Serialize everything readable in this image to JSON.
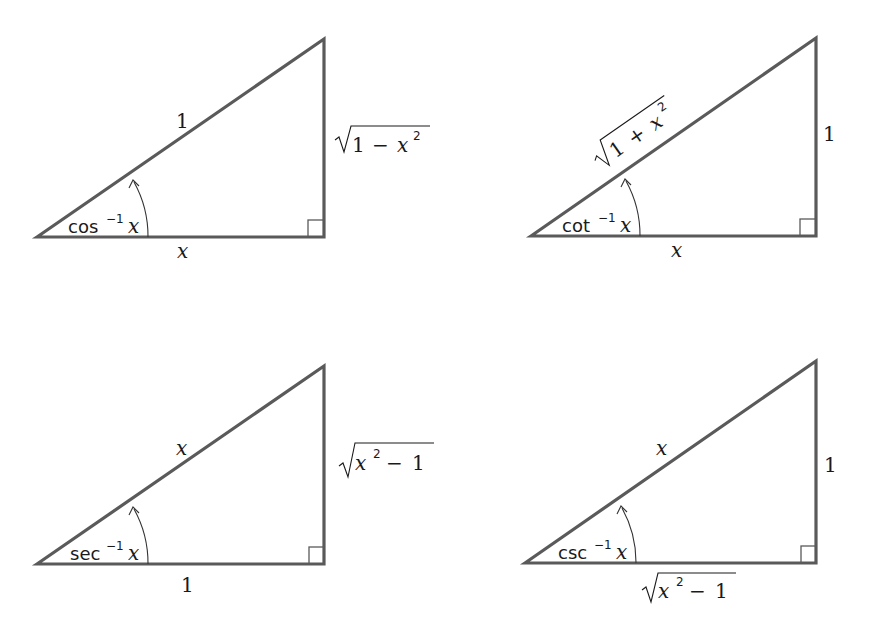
{
  "figure": {
    "triangles": [
      {
        "id": "arccos",
        "angle_label": {
          "fn": "cos",
          "exp": "−1",
          "arg": "x"
        },
        "hypotenuse": "1",
        "adjacent": "x",
        "opposite": {
          "radicand": "1 − x²",
          "display": "√(1 − x²)"
        }
      },
      {
        "id": "arccot",
        "angle_label": {
          "fn": "cot",
          "exp": "−1",
          "arg": "x"
        },
        "hypotenuse": {
          "radicand": "1 + x²",
          "display": "√(1 + x²)"
        },
        "adjacent": "x",
        "opposite": "1"
      },
      {
        "id": "arcsec",
        "angle_label": {
          "fn": "sec",
          "exp": "−1",
          "arg": "x"
        },
        "hypotenuse": "x",
        "adjacent": "1",
        "opposite": {
          "radicand": "x² − 1",
          "display": "√(x² − 1)"
        }
      },
      {
        "id": "arccsc",
        "angle_label": {
          "fn": "csc",
          "exp": "−1",
          "arg": "x"
        },
        "hypotenuse": "x",
        "adjacent": {
          "radicand": "x² − 1",
          "display": "√(x² − 1)"
        },
        "opposite": "1"
      }
    ],
    "glyphs": {
      "x": "x",
      "one": "1",
      "two": "2",
      "minus": "−",
      "plus": "+",
      "neg1": "−1"
    },
    "colors": {
      "edge": "#5a5a5a",
      "text": "#1a1a1a",
      "background": "#ffffff"
    }
  }
}
